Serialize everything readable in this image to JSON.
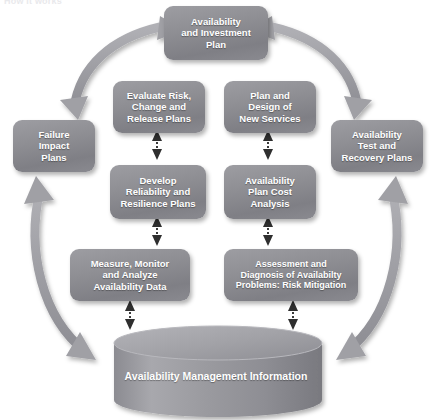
{
  "header": {
    "title": "How it works"
  },
  "diagram": {
    "type": "cycle-process-diagram",
    "colors": {
      "node_fill": "#8e8e93",
      "node_text": "#ffffff",
      "arrow": "#9a9a9f",
      "dotted_arrow": "#3b3b3b",
      "cylinder_fill": "#9a9a9f",
      "background": "#ffffff"
    },
    "nodes": [
      {
        "id": "availability-and-investment-plan",
        "label": "Availability\nand Investment\nPlan"
      },
      {
        "id": "evaluate-risk-change-and-release-plans",
        "label": "Evaluate Risk,\nChange and\nRelease Plans"
      },
      {
        "id": "plan-and-design-of-new-services",
        "label": "Plan and\nDesign of\nNew Services"
      },
      {
        "id": "failure-impact-plans",
        "label": "Failure\nImpact\nPlans"
      },
      {
        "id": "availability-test-and-recovery-plans",
        "label": "Availability\nTest and\nRecovery Plans"
      },
      {
        "id": "develop-reliability-and-resilience-plans",
        "label": "Develop\nReliability and\nResilience Plans"
      },
      {
        "id": "availability-plan-cost-analysis",
        "label": "Availability\nPlan Cost\nAnalysis"
      },
      {
        "id": "measure-monitor-and-analyze-availability-data",
        "label": "Measure, Monitor\nand Analyze\nAvailability Data"
      },
      {
        "id": "assessment-and-diagnosis-of-availability-problems",
        "label": "Assessment and\nDiagnosis of Availabilty\nProblems: Risk Mitigation"
      }
    ],
    "datastore": {
      "id": "availability-management-information",
      "label": "Availability Management Information",
      "shape": "cylinder"
    },
    "connectors": [
      {
        "id": "arc-top-left",
        "style": "solid-curved",
        "heads": "double"
      },
      {
        "id": "arc-top-right",
        "style": "solid-curved",
        "heads": "double"
      },
      {
        "id": "arc-left",
        "style": "solid-curved",
        "heads": "double"
      },
      {
        "id": "arc-right",
        "style": "solid-curved",
        "heads": "double"
      },
      {
        "id": "dotted-evaluate-develop",
        "style": "dotted",
        "heads": "double"
      },
      {
        "id": "dotted-plan-cost",
        "style": "dotted",
        "heads": "double"
      },
      {
        "id": "dotted-develop-measure",
        "style": "dotted",
        "heads": "double"
      },
      {
        "id": "dotted-cost-assessment",
        "style": "dotted",
        "heads": "double"
      },
      {
        "id": "dotted-measure-store",
        "style": "dotted",
        "heads": "double"
      },
      {
        "id": "dotted-assessment-store",
        "style": "dotted",
        "heads": "double"
      }
    ]
  }
}
